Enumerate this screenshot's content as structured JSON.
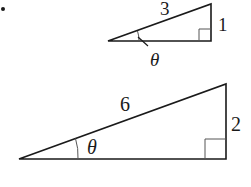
{
  "bullet": "•",
  "triangles": [
    {
      "name": "small-triangle",
      "hypotenuse": "3",
      "opposite": "1",
      "angle": "θ"
    },
    {
      "name": "large-triangle",
      "hypotenuse": "6",
      "opposite": "2",
      "angle": "θ"
    }
  ],
  "colors": {
    "stroke": "#1a1a1a",
    "right_angle": "#555555"
  }
}
